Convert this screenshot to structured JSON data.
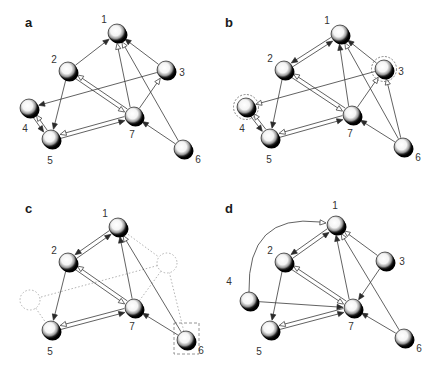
{
  "figure": {
    "colors": {
      "edge": "#3a3a3a",
      "node_dark": "#000000",
      "node_light": "#ffffff",
      "ghost": "#a9a9a9",
      "text": "#333333"
    },
    "panels": [
      {
        "id": "a",
        "label": "a",
        "nodes": [
          {
            "id": "1",
            "label": "1",
            "x": 117,
            "y": 33,
            "lx": -13,
            "ly": -10
          },
          {
            "id": "2",
            "label": "2",
            "x": 68,
            "y": 71,
            "lx": -14,
            "ly": -8
          },
          {
            "id": "3",
            "label": "3",
            "x": 166,
            "y": 70,
            "lx": 16,
            "ly": 6
          },
          {
            "id": "4",
            "label": "4",
            "x": 29,
            "y": 108,
            "lx": -4,
            "ly": 24
          },
          {
            "id": "5",
            "label": "5",
            "x": 51,
            "y": 139,
            "lx": -1,
            "ly": 25
          },
          {
            "id": "6",
            "label": "6",
            "x": 183,
            "y": 149,
            "lx": 15,
            "ly": 14
          },
          {
            "id": "7",
            "label": "7",
            "x": 134,
            "y": 116,
            "lx": -2,
            "ly": 22
          }
        ],
        "edges": [
          {
            "from": "2",
            "to": "1",
            "head": "filled"
          },
          {
            "from": "7",
            "to": "1",
            "head": "hollow",
            "offset": -2
          },
          {
            "from": "6",
            "to": "1",
            "head": "hollow"
          },
          {
            "from": "3",
            "to": "1",
            "head": "filled"
          },
          {
            "from": "7",
            "to": "3",
            "head": "hollow"
          },
          {
            "from": "3",
            "to": "4",
            "head": "filled"
          },
          {
            "from": "2",
            "to": "5",
            "head": "filled"
          },
          {
            "from": "2",
            "to": "7",
            "head": "hollow",
            "offset": 2
          },
          {
            "from": "7",
            "to": "2",
            "head": "hollow",
            "offset": 2
          },
          {
            "from": "4",
            "to": "5",
            "head": "filled",
            "offset": 2
          },
          {
            "from": "5",
            "to": "4",
            "head": "hollow",
            "offset": 2
          },
          {
            "from": "5",
            "to": "7",
            "head": "filled",
            "offset": 2
          },
          {
            "from": "7",
            "to": "5",
            "head": "hollow",
            "offset": 2
          },
          {
            "from": "6",
            "to": "7",
            "head": "filled"
          }
        ],
        "ghost_nodes": [],
        "ghost_edges": [],
        "highlight_circles": [],
        "highlight_boxes": [],
        "arcs": []
      },
      {
        "id": "b",
        "label": "b",
        "nodes": [
          {
            "id": "1",
            "label": "1",
            "x": 340,
            "y": 34,
            "lx": -13,
            "ly": -10
          },
          {
            "id": "2",
            "label": "2",
            "x": 284,
            "y": 70,
            "lx": -14,
            "ly": -8
          },
          {
            "id": "3",
            "label": "3",
            "x": 384,
            "y": 69,
            "lx": 17,
            "ly": 6
          },
          {
            "id": "4",
            "label": "4",
            "x": 246,
            "y": 107,
            "lx": -4,
            "ly": 25
          },
          {
            "id": "5",
            "label": "5",
            "x": 270,
            "y": 138,
            "lx": -1,
            "ly": 25
          },
          {
            "id": "6",
            "label": "6",
            "x": 403,
            "y": 147,
            "lx": 15,
            "ly": 14
          },
          {
            "id": "7",
            "label": "7",
            "x": 352,
            "y": 115,
            "lx": -2,
            "ly": 22
          }
        ],
        "edges": [
          {
            "from": "2",
            "to": "1",
            "head": "filled",
            "offset": 2
          },
          {
            "from": "1",
            "to": "2",
            "head": "filled",
            "offset": 2
          },
          {
            "from": "7",
            "to": "1",
            "head": "filled",
            "offset": -2
          },
          {
            "from": "6",
            "to": "1",
            "head": "hollow"
          },
          {
            "from": "3",
            "to": "1",
            "head": "filled"
          },
          {
            "from": "7",
            "to": "3",
            "head": "hollow"
          },
          {
            "from": "6",
            "to": "3",
            "head": "hollow"
          },
          {
            "from": "3",
            "to": "4",
            "head": "hollow"
          },
          {
            "from": "2",
            "to": "5",
            "head": "filled"
          },
          {
            "from": "2",
            "to": "7",
            "head": "hollow",
            "offset": 2
          },
          {
            "from": "7",
            "to": "2",
            "head": "hollow",
            "offset": 2
          },
          {
            "from": "4",
            "to": "5",
            "head": "filled",
            "offset": 2
          },
          {
            "from": "5",
            "to": "4",
            "head": "hollow",
            "offset": 2
          },
          {
            "from": "5",
            "to": "7",
            "head": "filled",
            "offset": 2
          },
          {
            "from": "7",
            "to": "5",
            "head": "hollow",
            "offset": 2
          },
          {
            "from": "6",
            "to": "7",
            "head": "filled"
          }
        ],
        "ghost_nodes": [],
        "ghost_edges": [],
        "highlight_circles": [
          "3",
          "4"
        ],
        "highlight_boxes": [],
        "arcs": []
      },
      {
        "id": "c",
        "label": "c",
        "nodes": [
          {
            "id": "1",
            "label": "1",
            "x": 118,
            "y": 227,
            "lx": -13,
            "ly": -10
          },
          {
            "id": "2",
            "label": "2",
            "x": 68,
            "y": 262,
            "lx": -14,
            "ly": -8
          },
          {
            "id": "5",
            "label": "5",
            "x": 51,
            "y": 330,
            "lx": -1,
            "ly": 25
          },
          {
            "id": "6",
            "label": "6",
            "x": 186,
            "y": 340,
            "lx": 15,
            "ly": 14
          },
          {
            "id": "7",
            "label": "7",
            "x": 134,
            "y": 308,
            "lx": -2,
            "ly": 22
          }
        ],
        "edges": [
          {
            "from": "2",
            "to": "1",
            "head": "filled",
            "offset": 2
          },
          {
            "from": "1",
            "to": "2",
            "head": "filled",
            "offset": 2
          },
          {
            "from": "7",
            "to": "1",
            "head": "filled"
          },
          {
            "from": "6",
            "to": "1",
            "head": "hollow"
          },
          {
            "from": "2",
            "to": "5",
            "head": "filled"
          },
          {
            "from": "2",
            "to": "7",
            "head": "hollow",
            "offset": 2
          },
          {
            "from": "7",
            "to": "2",
            "head": "hollow",
            "offset": 2
          },
          {
            "from": "5",
            "to": "7",
            "head": "filled",
            "offset": 2
          },
          {
            "from": "7",
            "to": "5",
            "head": "hollow",
            "offset": 2
          },
          {
            "from": "6",
            "to": "7",
            "head": "filled"
          }
        ],
        "ghost_nodes": [
          {
            "id": "3",
            "x": 167,
            "y": 263
          },
          {
            "id": "4",
            "x": 30,
            "y": 300
          }
        ],
        "ghost_edges": [
          {
            "from": "1",
            "to": "3g"
          },
          {
            "from": "3g",
            "to": "4g"
          },
          {
            "from": "4g",
            "to": "5"
          },
          {
            "from": "7",
            "to": "3g"
          },
          {
            "from": "6",
            "to": "3g"
          }
        ],
        "highlight_circles": [],
        "highlight_boxes": [
          "6"
        ],
        "arcs": []
      },
      {
        "id": "d",
        "label": "d",
        "nodes": [
          {
            "id": "1",
            "label": "1",
            "x": 336,
            "y": 225,
            "lx": -1,
            "ly": -16
          },
          {
            "id": "2",
            "label": "2",
            "x": 284,
            "y": 262,
            "lx": -14,
            "ly": -8
          },
          {
            "id": "3",
            "label": "3",
            "x": 385,
            "y": 261,
            "lx": 17,
            "ly": 4
          },
          {
            "id": "4",
            "label": "4",
            "x": 249,
            "y": 301,
            "lx": -20,
            "ly": -16
          },
          {
            "id": "5",
            "label": "5",
            "x": 270,
            "y": 330,
            "lx": -11,
            "ly": 25
          },
          {
            "id": "6",
            "label": "6",
            "x": 404,
            "y": 338,
            "lx": 15,
            "ly": 14
          },
          {
            "id": "7",
            "label": "7",
            "x": 353,
            "y": 308,
            "lx": -2,
            "ly": 22
          }
        ],
        "edges": [
          {
            "from": "2",
            "to": "1",
            "head": "filled",
            "offset": 2
          },
          {
            "from": "1",
            "to": "2",
            "head": "filled",
            "offset": 2
          },
          {
            "from": "7",
            "to": "1",
            "head": "filled",
            "offset": -2
          },
          {
            "from": "6",
            "to": "1",
            "head": "hollow"
          },
          {
            "from": "3",
            "to": "1",
            "head": "hollow"
          },
          {
            "from": "3",
            "to": "7",
            "head": "filled"
          },
          {
            "from": "4",
            "to": "7",
            "head": "filled"
          },
          {
            "from": "2",
            "to": "5",
            "head": "filled"
          },
          {
            "from": "2",
            "to": "7",
            "head": "hollow",
            "offset": 2
          },
          {
            "from": "7",
            "to": "2",
            "head": "hollow",
            "offset": 2
          },
          {
            "from": "5",
            "to": "7",
            "head": "filled",
            "offset": 2
          },
          {
            "from": "7",
            "to": "5",
            "head": "hollow",
            "offset": 2
          },
          {
            "from": "6",
            "to": "7",
            "head": "filled"
          }
        ],
        "ghost_nodes": [],
        "ghost_edges": [],
        "highlight_circles": [],
        "highlight_boxes": [],
        "arcs": [
          {
            "from": "4",
            "to": "1",
            "head": "hollow"
          }
        ]
      }
    ]
  }
}
